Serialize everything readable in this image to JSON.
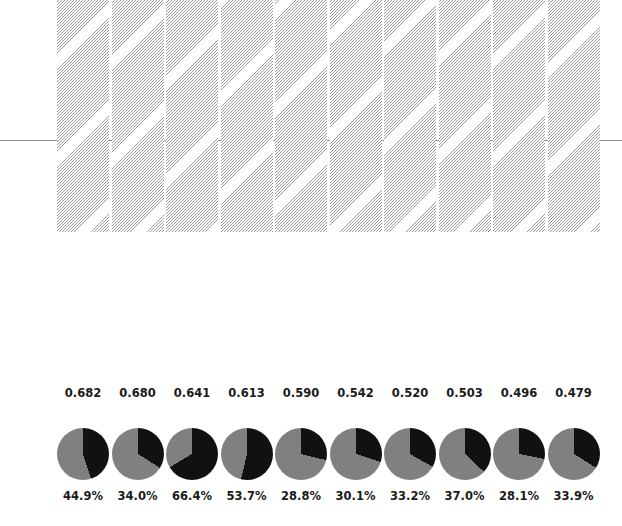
{
  "chart_data": {
    "type": "bar",
    "title": "",
    "subtitle": "",
    "xlabel": "",
    "ylabel": "",
    "grid": false,
    "legend": "none",
    "categories": [
      "1",
      "2",
      "3",
      "4",
      "5",
      "6",
      "7",
      "8",
      "9",
      "10"
    ],
    "values": [
      0.682,
      0.68,
      0.641,
      0.613,
      0.59,
      0.542,
      0.52,
      0.503,
      0.496,
      0.479
    ],
    "value_labels": [
      "0.682",
      "0.680",
      "0.641",
      "0.613",
      "0.590",
      "0.542",
      "0.520",
      "0.503",
      "0.496",
      "0.479"
    ],
    "ylim": [
      0,
      0.715
    ],
    "reference_line": {
      "value": 0.45,
      "color": "#8c8c8c",
      "style": "solid"
    },
    "bar_style": {
      "fill": "hatched",
      "hatch": "diagonal",
      "hatch_color": "#9a9a9a",
      "face_color": "#ffffff"
    },
    "pies": {
      "type": "pie",
      "slice_labels": [
        "black-share",
        "gray-share"
      ],
      "colors": [
        "#111111",
        "#808080"
      ],
      "start_angle_deg": 0,
      "direction": "clockwise",
      "values": [
        44.9,
        34.0,
        66.4,
        53.7,
        28.8,
        30.1,
        33.2,
        37.0,
        28.1,
        33.9
      ],
      "percent_labels": [
        "44.9%",
        "34.0%",
        "66.4%",
        "53.7%",
        "28.8%",
        "30.1%",
        "33.2%",
        "37.0%",
        "28.1%",
        "33.9%"
      ]
    }
  },
  "colors": {
    "background": "#ffffff",
    "bar_hatch": "#9a9a9a",
    "pie_dark": "#111111",
    "pie_light": "#808080",
    "text": "#1a1a1a",
    "reference_line": "#8c8c8c"
  }
}
